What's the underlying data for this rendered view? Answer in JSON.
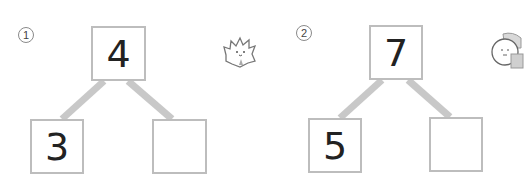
{
  "problems": [
    {
      "marker": "1",
      "whole": "4",
      "part_left": "3",
      "part_right": "",
      "mascot": "spiky-hair-character-icon"
    },
    {
      "marker": "2",
      "whole": "7",
      "part_left": "5",
      "part_right": "",
      "mascot": "round-face-character-icon"
    }
  ],
  "colors": {
    "box_border": "#bdbdbd",
    "connector": "#c8c8c8",
    "digit": "#222222"
  }
}
